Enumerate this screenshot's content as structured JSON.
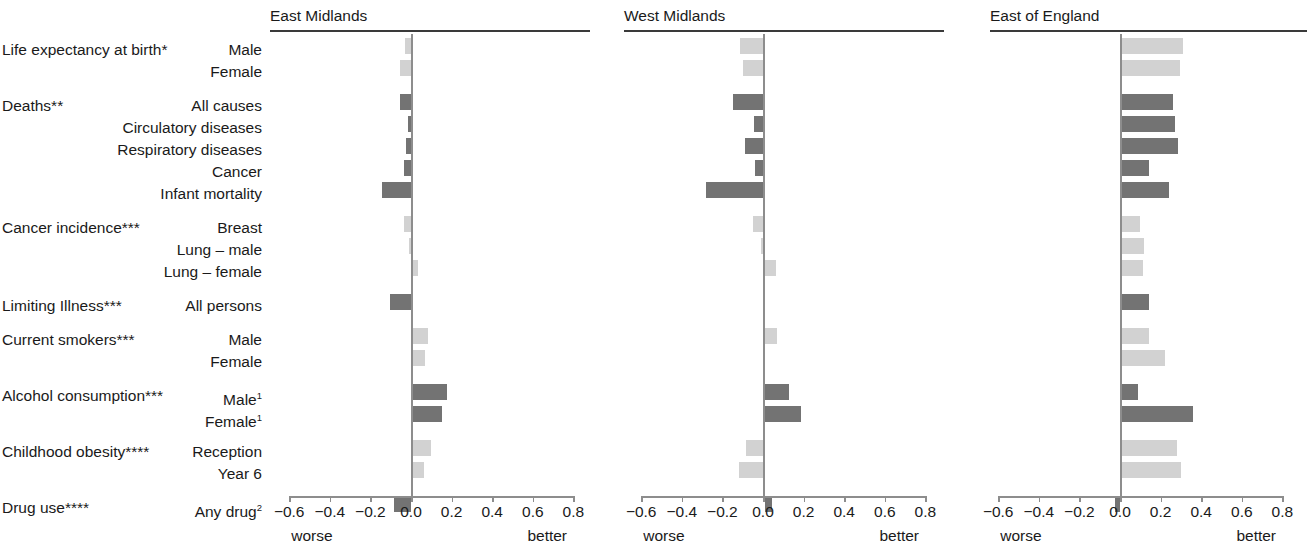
{
  "chart_data": {
    "type": "bar",
    "title": "",
    "subtitle": "",
    "orientation": "horizontal",
    "xlabel": "",
    "ylabel": "",
    "xlim": [
      -0.6,
      0.8
    ],
    "grid": false,
    "legend_position": "none",
    "axis": {
      "ticks": [
        "−0.6",
        "−0.4",
        "−0.2",
        "0.0",
        "0.2",
        "0.4",
        "0.6",
        "0.8"
      ],
      "tick_values": [
        -0.6,
        -0.4,
        -0.2,
        0.0,
        0.2,
        0.4,
        0.6,
        0.8
      ],
      "left_end_label": "worse",
      "right_end_label": "better"
    },
    "colors": {
      "dark_bar": "#737373",
      "light_bar": "#d2d2d2",
      "axis": "#8d8d8d",
      "rule": "#3a3a3a",
      "text": "#1a1a1a"
    },
    "groups": [
      {
        "title": "Life expectancy at birth*",
        "categories": [
          "Male",
          "Female"
        ],
        "shade": [
          "light",
          "light"
        ]
      },
      {
        "title": "Deaths**",
        "categories": [
          "All causes",
          "Circulatory diseases",
          "Respiratory diseases",
          "Cancer",
          "Infant mortality"
        ],
        "shade": [
          "dark",
          "dark",
          "dark",
          "dark",
          "dark"
        ]
      },
      {
        "title": "Cancer incidence***",
        "categories": [
          "Breast",
          "Lung – male",
          "Lung – female"
        ],
        "shade": [
          "light",
          "light",
          "light"
        ]
      },
      {
        "title": "Limiting Illness***",
        "categories": [
          "All persons"
        ],
        "shade": [
          "dark"
        ]
      },
      {
        "title": "Current smokers***",
        "categories": [
          "Male",
          "Female"
        ],
        "shade": [
          "light",
          "light"
        ]
      },
      {
        "title": "Alcohol consumption***",
        "categories": [
          "Male¹",
          "Female¹"
        ],
        "shade": [
          "dark",
          "dark"
        ]
      },
      {
        "title": "Childhood obesity****",
        "categories": [
          "Reception",
          "Year 6"
        ],
        "shade": [
          "light",
          "light"
        ]
      },
      {
        "title": "Drug use****",
        "categories": [
          "Any drug²"
        ],
        "shade": [
          "dark"
        ]
      }
    ],
    "categories": [
      "Life expectancy at birth* – Male",
      "Life expectancy at birth* – Female",
      "Deaths** – All causes",
      "Deaths** – Circulatory diseases",
      "Deaths** – Respiratory diseases",
      "Deaths** – Cancer",
      "Deaths** – Infant mortality",
      "Cancer incidence*** – Breast",
      "Cancer incidence*** – Lung – male",
      "Cancer incidence*** – Lung – female",
      "Limiting Illness*** – All persons",
      "Current smokers*** – Male",
      "Current smokers*** – Female",
      "Alcohol consumption*** – Male¹",
      "Alcohol consumption*** – Female¹",
      "Childhood obesity**** – Reception",
      "Childhood obesity**** – Year 6",
      "Drug use**** – Any drug²"
    ],
    "series": [
      {
        "name": "East Midlands",
        "values": [
          -0.03,
          -0.055,
          -0.055,
          -0.015,
          -0.025,
          -0.035,
          -0.145,
          -0.035,
          -0.005,
          0.025,
          -0.105,
          0.075,
          0.06,
          0.17,
          0.145,
          0.09,
          0.055,
          -0.085
        ]
      },
      {
        "name": "West Midlands",
        "values": [
          -0.115,
          -0.1,
          -0.15,
          -0.045,
          -0.09,
          -0.04,
          -0.28,
          -0.05,
          -0.01,
          0.055,
          0.0,
          0.06,
          0.0,
          0.12,
          0.18,
          -0.085,
          -0.12,
          0.035
        ]
      },
      {
        "name": "East of England",
        "values": [
          0.305,
          0.29,
          0.255,
          0.265,
          0.28,
          0.135,
          0.235,
          0.09,
          0.11,
          0.105,
          0.135,
          0.135,
          0.215,
          0.08,
          0.35,
          0.275,
          0.295,
          -0.025
        ]
      }
    ]
  },
  "panels": [
    {
      "title": "East Midlands"
    },
    {
      "title": "West Midlands"
    },
    {
      "title": "East of England"
    }
  ]
}
